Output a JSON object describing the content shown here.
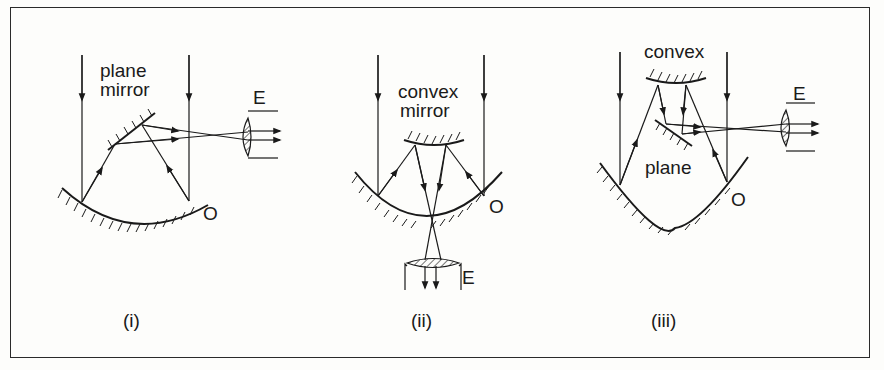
{
  "figure": {
    "panels": [
      {
        "id": "i",
        "caption": "(i)",
        "secondary_mirror_label_line1": "plane",
        "secondary_mirror_label_line2": "mirror",
        "eyepiece_label": "E",
        "objective_label": "O"
      },
      {
        "id": "ii",
        "caption": "(ii)",
        "secondary_mirror_label_line1": "convex",
        "secondary_mirror_label_line2": "mirror",
        "eyepiece_label": "E",
        "objective_label": "O"
      },
      {
        "id": "iii",
        "caption": "(iii)",
        "secondary_mirror_label": "convex",
        "tertiary_mirror_label": "plane",
        "eyepiece_label": "E",
        "objective_label": "O"
      }
    ]
  }
}
